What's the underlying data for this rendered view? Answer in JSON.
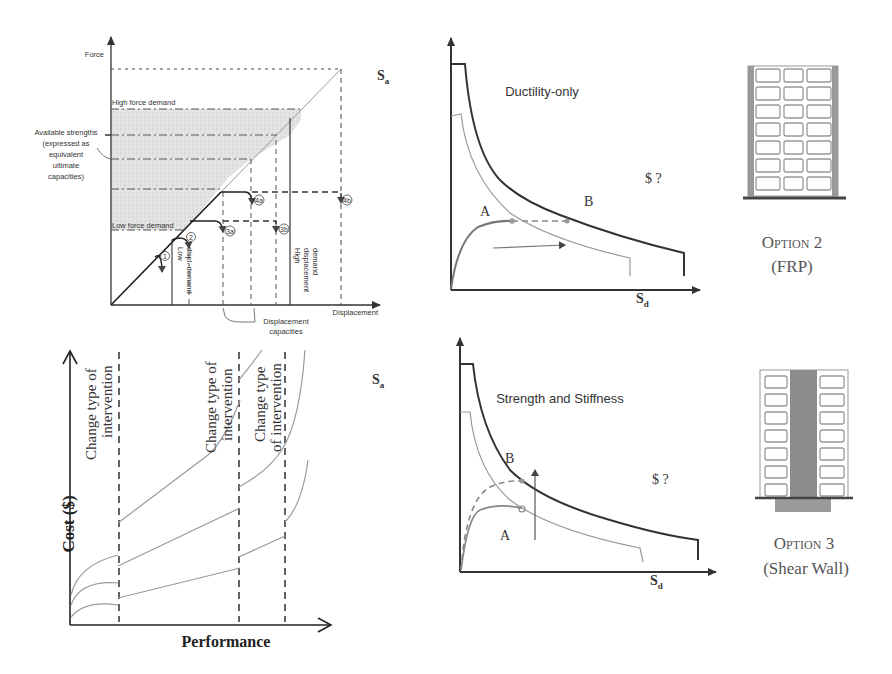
{
  "panel_force_displacement": {
    "y_axis_label": "Force",
    "x_axis_label": "Displacement",
    "high_force_label": "High force demand",
    "low_force_label": "Low force demand",
    "available_strengths_lines": [
      "Available strengths",
      "(expressed as",
      "equivalent",
      "ultimate",
      "capacities)"
    ],
    "displacement_capacities_lines": [
      "Displacement",
      "capacities"
    ],
    "low_disp_demand_lines": [
      "Low",
      "displ. demand"
    ],
    "high_disp_demand_lines": [
      "High",
      "displacement",
      "demand"
    ],
    "markers": [
      "1",
      "2",
      "3a",
      "3b",
      "4a",
      "4b"
    ]
  },
  "panel_cost_performance": {
    "y_axis_label": "Cost ($)",
    "x_axis_label": "Performance",
    "annotations": [
      {
        "line1": "Change type of",
        "line2": "intervention"
      },
      {
        "line1": "Change type of",
        "line2": "intervention"
      },
      {
        "line1": "Change type",
        "line2": "of intervention"
      }
    ]
  },
  "panel_ductility": {
    "title": "Ductility-only",
    "y_axis_label": "S",
    "y_axis_sub": "a",
    "x_axis_label": "S",
    "x_axis_sub": "d",
    "point_a": "A",
    "point_b": "B",
    "cost_label": "$ ?"
  },
  "panel_strength": {
    "title": "Strength and Stiffness",
    "y_axis_label": "S",
    "y_axis_sub": "a",
    "x_axis_label": "S",
    "x_axis_sub": "d",
    "point_a": "A",
    "point_b": "B",
    "cost_label": "$ ?"
  },
  "option2": {
    "title": "Option 2",
    "subtitle": "(FRP)"
  },
  "option3": {
    "title": "Option 3",
    "subtitle": "(Shear Wall)"
  },
  "colors": {
    "ink": "#333333",
    "light_curve": "#9a9a9a",
    "shade": "#dcdcdc",
    "shear_wall": "#8c8c8c"
  }
}
